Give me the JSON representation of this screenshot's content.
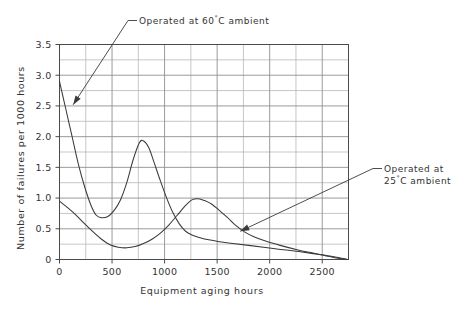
{
  "chart_data": {
    "type": "line",
    "title": "",
    "xlabel": "Equipment aging hours",
    "ylabel": "Number of failures per 1000 hours",
    "xlim": [
      0,
      2750
    ],
    "ylim": [
      0,
      3.5
    ],
    "grid": true,
    "grid_x_step": 250,
    "grid_y_step": 0.25,
    "legend_position": "annotations",
    "xticks": [
      0,
      500,
      1000,
      1500,
      2000,
      2500
    ],
    "xticklabels": [
      "0",
      "500",
      "1000",
      "1500",
      "2000",
      "2500"
    ],
    "yticks": [
      0,
      0.5,
      1.0,
      1.5,
      2.0,
      2.5,
      3.0,
      3.5
    ],
    "yticklabels": [
      "0",
      "0.5",
      "1.0",
      "1.5",
      "2.0",
      "2.5",
      "3.0",
      "3.5"
    ],
    "series": [
      {
        "name": "Operated at 60°C ambient",
        "points": [
          [
            0,
            2.9
          ],
          [
            60,
            2.45
          ],
          [
            120,
            2.0
          ],
          [
            180,
            1.55
          ],
          [
            240,
            1.18
          ],
          [
            300,
            0.88
          ],
          [
            350,
            0.72
          ],
          [
            400,
            0.68
          ],
          [
            460,
            0.7
          ],
          [
            520,
            0.8
          ],
          [
            580,
            0.97
          ],
          [
            640,
            1.25
          ],
          [
            700,
            1.62
          ],
          [
            760,
            1.9
          ],
          [
            800,
            1.93
          ],
          [
            850,
            1.82
          ],
          [
            900,
            1.58
          ],
          [
            960,
            1.28
          ],
          [
            1020,
            1.0
          ],
          [
            1080,
            0.76
          ],
          [
            1140,
            0.58
          ],
          [
            1200,
            0.46
          ],
          [
            1260,
            0.4
          ],
          [
            1330,
            0.36
          ],
          [
            1420,
            0.32
          ],
          [
            1520,
            0.29
          ],
          [
            1650,
            0.26
          ],
          [
            1800,
            0.23
          ],
          [
            1980,
            0.19
          ],
          [
            2180,
            0.15
          ],
          [
            2400,
            0.1
          ],
          [
            2600,
            0.05
          ],
          [
            2750,
            0.0
          ]
        ]
      },
      {
        "name": "Operated at 25°C ambient",
        "points": [
          [
            0,
            0.95
          ],
          [
            80,
            0.84
          ],
          [
            160,
            0.72
          ],
          [
            240,
            0.58
          ],
          [
            320,
            0.45
          ],
          [
            400,
            0.33
          ],
          [
            480,
            0.24
          ],
          [
            560,
            0.2
          ],
          [
            640,
            0.19
          ],
          [
            720,
            0.21
          ],
          [
            800,
            0.26
          ],
          [
            880,
            0.33
          ],
          [
            960,
            0.43
          ],
          [
            1040,
            0.56
          ],
          [
            1120,
            0.72
          ],
          [
            1200,
            0.88
          ],
          [
            1260,
            0.97
          ],
          [
            1320,
            0.99
          ],
          [
            1380,
            0.96
          ],
          [
            1450,
            0.9
          ],
          [
            1520,
            0.8
          ],
          [
            1600,
            0.68
          ],
          [
            1680,
            0.55
          ],
          [
            1760,
            0.45
          ],
          [
            1850,
            0.37
          ],
          [
            1960,
            0.3
          ],
          [
            2100,
            0.23
          ],
          [
            2260,
            0.16
          ],
          [
            2450,
            0.09
          ],
          [
            2620,
            0.03
          ],
          [
            2750,
            0.0
          ]
        ]
      }
    ],
    "annotations": [
      {
        "id": "annotation-60c",
        "label": "Operated at 60",
        "degree": "°",
        "label_tail": "C ambient",
        "full_text": "Operated at 60°C ambient",
        "target_x": 130,
        "target_y": 2.52
      },
      {
        "id": "annotation-25c",
        "label_line1": "Operated at",
        "label_line2_prefix": "25",
        "degree": "°",
        "label_line2_tail": "C ambient",
        "full_text": "Operated at 25°C ambient",
        "target_x": 1720,
        "target_y": 0.46
      }
    ]
  },
  "figure": {
    "background_color": "#ffffff",
    "curve_color": "#3a3a3a",
    "grid_major_color": "#8f8f8f",
    "grid_minor_color": "#b4b4b4",
    "axis_color": "#4a4a4a",
    "text_color": "#333333"
  }
}
